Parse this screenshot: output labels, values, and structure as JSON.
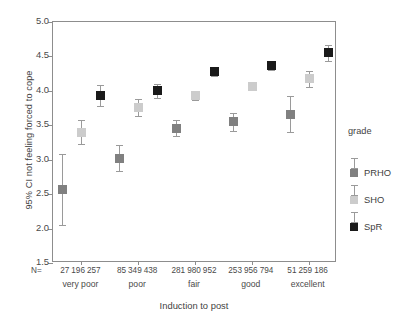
{
  "chart_data": {
    "type": "scatter",
    "title": "",
    "xlabel": "Induction to post",
    "ylabel": "95% CI  not feeling forced to cope",
    "ylim": [
      1.5,
      5.0
    ],
    "yticks": [
      "1.5",
      "2.0",
      "2.5",
      "3.0",
      "3.5",
      "4.0",
      "4.5",
      "5.0"
    ],
    "ytick_values": [
      1.5,
      2.0,
      2.5,
      3.0,
      3.5,
      4.0,
      4.5,
      5.0
    ],
    "grid": false,
    "legend_position": "right",
    "legend_title": "grade",
    "categories": [
      "very poor",
      "poor",
      "fair",
      "good",
      "excellent"
    ],
    "n_label": "N=",
    "series": [
      {
        "name": "PRHO",
        "color": "#808080",
        "values": [
          2.57,
          3.02,
          3.45,
          3.55,
          3.65
        ],
        "ci_low": [
          2.05,
          2.84,
          3.35,
          3.42,
          3.4
        ],
        "ci_high": [
          3.08,
          3.22,
          3.58,
          3.68,
          3.92
        ],
        "n": [
          27,
          85,
          281,
          253,
          51
        ]
      },
      {
        "name": "SHO",
        "color": "#cccccc",
        "values": [
          3.39,
          3.76,
          3.93,
          4.06,
          4.18
        ],
        "ci_low": [
          3.23,
          3.64,
          3.87,
          4.01,
          4.05
        ],
        "ci_high": [
          3.57,
          3.88,
          4.0,
          4.12,
          4.29
        ],
        "n": [
          196,
          349,
          980,
          956,
          259
        ]
      },
      {
        "name": "SpR",
        "color": "#1a1a1a",
        "values": [
          3.93,
          4.0,
          4.28,
          4.37,
          4.55
        ],
        "ci_low": [
          3.78,
          3.9,
          4.21,
          4.3,
          4.44
        ],
        "ci_high": [
          4.08,
          4.1,
          4.34,
          4.43,
          4.66
        ],
        "n": [
          257,
          438,
          952,
          794,
          186
        ]
      }
    ]
  },
  "axes": {
    "y_title": "95% CI  not feeling forced to cope",
    "x_title": "Induction to post",
    "n_prefix": "N="
  },
  "legend": {
    "title": "grade",
    "items": [
      {
        "label": "PRHO",
        "color": "#808080"
      },
      {
        "label": "SHO",
        "color": "#cccccc"
      },
      {
        "label": "SpR",
        "color": "#1a1a1a"
      }
    ]
  }
}
